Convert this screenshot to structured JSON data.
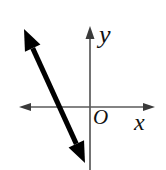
{
  "figure": {
    "type": "coordinate-plane-with-line",
    "title": "",
    "background_color": "#ffffff",
    "width": 166,
    "height": 170,
    "labels": {
      "x_axis": "x",
      "y_axis": "y",
      "origin": "O"
    },
    "colors": {
      "axis": "#5a5a5a",
      "line": "#000000",
      "label": "#111111"
    }
  },
  "chart_data": {
    "type": "line",
    "title": "",
    "xlabel": "x",
    "ylabel": "y",
    "grid": false,
    "legend": null,
    "annotations": [
      "O"
    ],
    "axes": {
      "x_axis": {
        "pixel_y": 107,
        "pixel_x_start": 19,
        "pixel_x_end": 155,
        "arrows": "both",
        "label": "x"
      },
      "y_axis": {
        "pixel_x": 90,
        "pixel_y_start": 27,
        "pixel_y_end": 170,
        "arrows": "up",
        "label": "y"
      },
      "origin_pixel": [
        90,
        107
      ]
    },
    "series": [
      {
        "name": "line",
        "style": "double-headed-arrow",
        "stroke_width": 5,
        "color": "#000000",
        "endpoints_pixel": [
          [
            24,
            29
          ],
          [
            85,
            163
          ]
        ],
        "x_intercept_pixel": [
          59,
          107
        ],
        "slope_sign": "negative",
        "slope_estimate": -2.2,
        "description": "steep line with negative slope crossing the x-axis left of the origin and extending below the origin"
      }
    ]
  }
}
